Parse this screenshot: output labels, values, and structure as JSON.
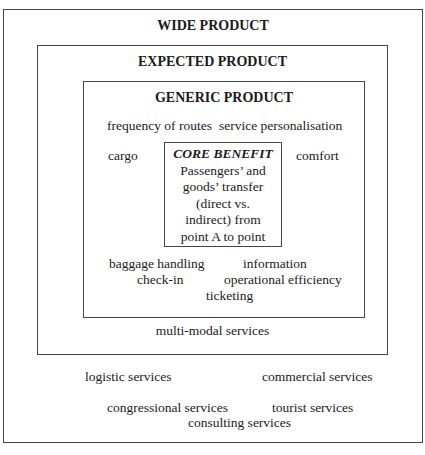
{
  "diagram": {
    "wide_product": {
      "title": "WIDE PRODUCT",
      "items": [
        "logistic services",
        "commercial services",
        "congressional services",
        "tourist services",
        "consulting services"
      ]
    },
    "expected_product": {
      "title": "EXPECTED PRODUCT",
      "items": [
        "multi-modal services"
      ]
    },
    "generic_product": {
      "title": "GENERIC PRODUCT",
      "items": [
        "frequency of routes",
        "service personalisation",
        "cargo",
        "comfort",
        "baggage handling",
        "information",
        "check-in",
        "operational efficiency",
        "ticketing"
      ]
    },
    "core_benefit": {
      "title": "CORE BENEFIT",
      "lines": [
        "Passengers’ and",
        "goods’ transfer",
        "(direct vs.",
        "indirect) from",
        "point A to point"
      ]
    }
  }
}
